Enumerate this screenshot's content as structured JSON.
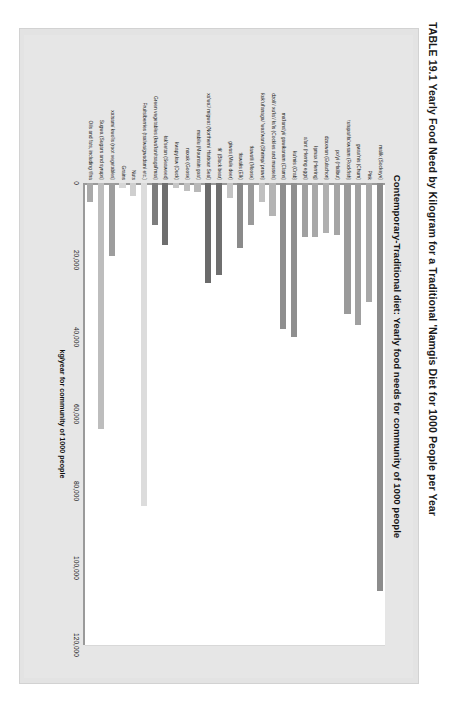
{
  "caption": {
    "table_number": "TABLE 19.1",
    "text": "TABLE 19.1  Yearly Food Need by Kilogram for a Traditional 'Namgis Diet for 1000 People per Year"
  },
  "chart_data": {
    "type": "bar",
    "orientation": "horizontal",
    "title": "Contemporary-Traditional diet: Yearly food needs for community of 1000 people",
    "xlabel": "kg/year for community of 1000 people",
    "ylabel": "",
    "xlim": [
      0,
      120000
    ],
    "xticks": [
      0,
      20000,
      40000,
      60000,
      80000,
      100000,
      120000
    ],
    "xticklabels": [
      "0",
      "20,000",
      "40,000",
      "60,000",
      "80,000",
      "100,000",
      "120,000"
    ],
    "grid": true,
    "legend": "none",
    "categories": [
      "malik (Sockeye)",
      "Pink",
      "gwax'nis (Chum)",
      "tutupa/tła'xwsam (Rockfish)",
      "po'yi (Halibut)",
      "dzaxwan (Eulachon)",
      "ła̱max (Herring)",
      "a'ant (Herring eggs)",
      "ƙu'mis (Crab)",
      "ma'łana'yi/ gawiƙanam (Clams)",
      "dzoliʼ/ xuʼłaʼ/ ła'is (Cockles and mussels)",
      "ƙukʼułʼanaga/ 'was'wani (Shrimp/ prawn)",
      "tławatłi (Moose)",
      "tławałis (Elk)",
      "giwas (Mule deer)",
      "tłiʼ (Black bear)",
      "xa'waʼ/ migwat (Northern/ Harbour Seal)",
      "mabilu (Mountain goat)",
      "naxak (Goose)",
      "ƙwapy.ław (Duck)",
      "łak'setan (Seaweed)",
      "Green vegetables (ƙwa'łan/tsagał'mas)",
      "Fruits/berries (tsalwa/gwadam/ etc.)",
      "Nuts",
      "Grains",
      "xatsam/ kwo'is (root vegetables)",
      "Sugwa (Sugars and syrups)",
      "Oils and fats, including tł'na"
    ],
    "values": [
      106000,
      31000,
      37000,
      34000,
      13500,
      13000,
      14000,
      14000,
      40000,
      38000,
      8500,
      5000,
      11000,
      17000,
      4000,
      24000,
      26000,
      2300,
      2000,
      1400,
      16000,
      11000,
      84000,
      3500,
      1200,
      19000,
      64000,
      5000
    ],
    "bar_colors": [
      "#8c8c8c",
      "#a8a8a8",
      "#a0a0a0",
      "#9a9a9a",
      "#a5a5a5",
      "#b0b0b0",
      "#a8a8a8",
      "#a0a0a0",
      "#8f8f8f",
      "#8f8f8f",
      "#b4b4b4",
      "#c0c0c0",
      "#9a9a9a",
      "#8a8a8a",
      "#c4c4c4",
      "#6f6f6f",
      "#6a6a6a",
      "#b8b8b8",
      "#bfbfbf",
      "#c6c6c6",
      "#6e6e6e",
      "#7d7d7d",
      "#dcdcdc",
      "#cfcfcf",
      "#d6d6d6",
      "#9d9d9d",
      "#bdbdbd",
      "#a9a9a9"
    ]
  }
}
